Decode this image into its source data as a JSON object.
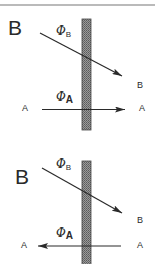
{
  "figure": {
    "type": "membrane flux diagram",
    "colors": {
      "line": "#2a2a2a",
      "membrane_fill": "#8a8a8a",
      "membrane_edge": "#444444",
      "border": "#777777",
      "background": "#ffffff"
    },
    "panels": [
      {
        "panel_label": "B",
        "membrane": "vertical hatched bar",
        "flux_b": {
          "symbol": "Φ",
          "subscript": "B",
          "direction": "left-to-right (diagonal, downward)",
          "end_label": "B"
        },
        "flux_a": {
          "symbol": "Φ",
          "subscript": "A",
          "direction": "left-to-right",
          "left_label": "A",
          "right_label": "A"
        }
      },
      {
        "panel_label": "B",
        "membrane": "vertical hatched bar",
        "flux_b": {
          "symbol": "Φ",
          "subscript": "B",
          "direction": "left-to-right (diagonal, downward)",
          "end_label": "B"
        },
        "flux_a": {
          "symbol": "Φ",
          "subscript": "A",
          "direction": "right-to-left",
          "left_label": "A",
          "right_label": "A"
        }
      }
    ]
  }
}
